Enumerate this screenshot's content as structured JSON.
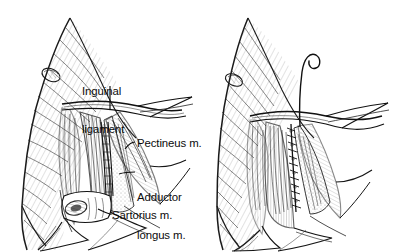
{
  "figure": {
    "kind": "medical-line-illustration",
    "background_color": "#ffffff",
    "ink_color": "#111111",
    "panels": [
      {
        "id": "left-panel",
        "name": "open-dissection-view",
        "description": "Groin / femoral triangle exposed by incision, skin flaps retracted, muscles and femoral vessels visible"
      },
      {
        "id": "right-panel",
        "name": "sutured-repair-view",
        "description": "Same groin region after closure, running suture line down the wound with a free suture thread curling above"
      }
    ]
  },
  "labels": {
    "inguinal_ligament": "Inguinal\nligament",
    "inguinal_ligament_line1": "Inguinal",
    "inguinal_ligament_line2": "ligament",
    "pectineus": "Pectineus m.",
    "adductor_longus_line1": "Adductor",
    "adductor_longus_line2": "longus m.",
    "adductor_longus": "Adductor longus m.",
    "sartorius": "Sartorius m."
  },
  "leaders": {
    "inguinal_ligament": "vertical line from below the word 'ligament' down to the inguinal ligament band",
    "pectineus": "short diagonal tick from label left edge to pectineus muscle belly",
    "adductor_longus": "short diagonal tick from label left edge to adductor longus muscle",
    "sartorius": "short diagonal tick from label left edge to the cut sartorius muscle stump"
  },
  "annotations": {
    "suture_thread": "free curled suture strand rising above the closed wound",
    "suture_line": "running interrupted stitches closing the wound"
  }
}
